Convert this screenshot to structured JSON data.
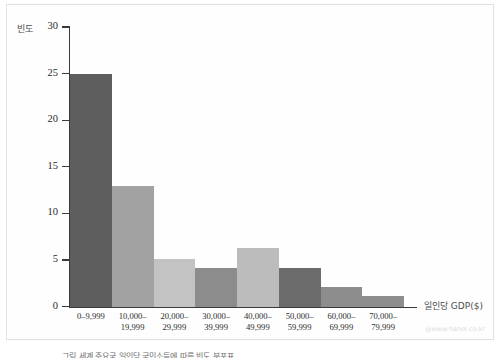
{
  "figure": {
    "ylabel": "빈도",
    "xlabel": "일인당 GDP($)",
    "watermark": "@www.hanol.co.kr",
    "caption": "그림 세계 주요국 일인당 국민소득에 따른 빈도 분포표",
    "caption_marker": "",
    "axis_color": "#3a3a3a",
    "frame_color": "#e2e2e2",
    "background": "#ffffff"
  },
  "chart_data": {
    "type": "bar",
    "title": "",
    "xlabel": "일인당 GDP($)",
    "ylabel": "빈도",
    "ylim": [
      0,
      30
    ],
    "yticks": [
      0,
      5,
      10,
      15,
      20,
      25,
      30
    ],
    "ytick_labels": [
      "0",
      "5",
      "10",
      "15",
      "20",
      "25",
      "30"
    ],
    "grid": false,
    "legend": false,
    "categories": [
      "0–9,999",
      "10,000–\n19,999",
      "20,000–\n29,999",
      "30,000–\n39,999",
      "40,000–\n49,999",
      "50,000–\n59,999",
      "60,000–\n69,999",
      "70,000–\n79,999"
    ],
    "values": [
      25,
      13,
      5.2,
      4.2,
      6.3,
      4.2,
      2.2,
      1.2
    ],
    "bar_colors": [
      "#5e5e5e",
      "#a2a2a2",
      "#c3c3c3",
      "#8c8c8c",
      "#bcbcbc",
      "#6c6c6c",
      "#8d8d8d",
      "#8d8d8d"
    ]
  }
}
